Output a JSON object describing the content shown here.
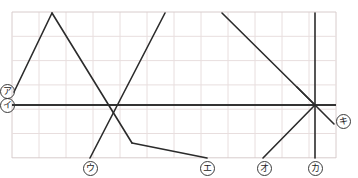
{
  "figure": {
    "type": "line-segment-diagram",
    "background": "#ffffff",
    "grid": {
      "visible": true,
      "color": "#e8dede",
      "border_color": "#d8cccc",
      "x_start": 12,
      "x_end": 336,
      "y_start": 12,
      "y_end": 158,
      "cell_width": 27,
      "cell_height": 24.3,
      "cols": 12,
      "rows": 6
    },
    "axis": {
      "name": "horizontal-axis",
      "color": "#333333",
      "width": 2,
      "y": 105,
      "x1": 12,
      "x2": 336
    },
    "line_color": "#2b2b2b",
    "line_width": 1.6,
    "convergence_point": {
      "x": 315,
      "y": 105
    },
    "segments": [
      {
        "name": "segment-a-rise",
        "label": "ア",
        "x1": 14,
        "y1": 92,
        "x2": 52,
        "y2": 13
      },
      {
        "name": "segment-a-fall",
        "label": "",
        "x1": 52,
        "y1": 13,
        "x2": 132,
        "y2": 143
      },
      {
        "name": "segment-c",
        "label": "ウ",
        "x1": 90,
        "y1": 158,
        "x2": 165,
        "y2": 13
      },
      {
        "name": "segment-d",
        "label": "エ",
        "x1": 132,
        "y1": 143,
        "x2": 207,
        "y2": 158
      },
      {
        "name": "segment-e-diagonal",
        "label": "",
        "x1": 222,
        "y1": 13,
        "x2": 315,
        "y2": 105
      },
      {
        "name": "segment-f",
        "label": "オ",
        "x1": 263,
        "y1": 158,
        "x2": 315,
        "y2": 105
      },
      {
        "name": "segment-g-vertical",
        "label": "カ",
        "x1": 315,
        "y1": 13,
        "x2": 315,
        "y2": 158
      },
      {
        "name": "segment-h",
        "label": "キ",
        "x1": 297,
        "y1": 87,
        "x2": 334,
        "y2": 124
      }
    ]
  },
  "labels": [
    {
      "name": "label-a",
      "text": "ア",
      "x": 0,
      "y": 84
    },
    {
      "name": "label-i",
      "text": "イ",
      "x": 0,
      "y": 98
    },
    {
      "name": "label-u",
      "text": "ウ",
      "x": 83,
      "y": 161
    },
    {
      "name": "label-e",
      "text": "エ",
      "x": 200,
      "y": 161
    },
    {
      "name": "label-o",
      "text": "オ",
      "x": 257,
      "y": 161
    },
    {
      "name": "label-ka",
      "text": "カ",
      "x": 308,
      "y": 161
    },
    {
      "name": "label-ki",
      "text": "キ",
      "x": 336,
      "y": 114
    }
  ]
}
